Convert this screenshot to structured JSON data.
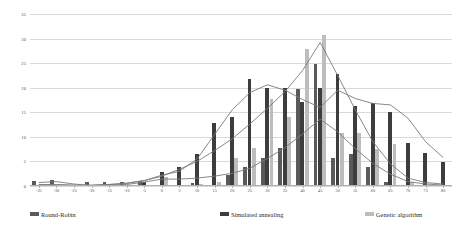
{
  "chart_data": {
    "type": "bar",
    "title": "",
    "subtitle": "",
    "xlabel": "",
    "ylabel": "",
    "xlim": [
      -37.5,
      82.5
    ],
    "ylim": [
      0,
      35
    ],
    "grid": true,
    "legend_position": "bottom",
    "y_ticks": [
      0,
      5,
      10,
      15,
      20,
      25,
      30,
      35
    ],
    "categories": [
      "-35",
      "-30",
      "-25",
      "-20",
      "-15",
      "-10",
      "-5",
      "0",
      "5",
      "10",
      "15",
      "20",
      "25",
      "30",
      "35",
      "40",
      "45",
      "50",
      "55",
      "60",
      "65",
      "70",
      "75",
      "80"
    ],
    "series": [
      {
        "name": "Round-Robin",
        "color": "#5a5a5a",
        "values": [
          1,
          1.2,
          0,
          0.8,
          0.8,
          0.8,
          1,
          0,
          0,
          0.6,
          0,
          2.2,
          3.8,
          5.8,
          7.8,
          19.8,
          24.9,
          5.8,
          6.5,
          3.8,
          0.8,
          0,
          0,
          0
        ]
      },
      {
        "name": "Simulated annealing",
        "color": "#3d3d3d",
        "values": [
          0,
          0,
          0,
          0,
          0,
          0,
          0.8,
          2.8,
          3.8,
          6.5,
          12.8,
          14,
          21.8,
          20,
          20,
          17,
          20,
          22.8,
          16.2,
          16.8,
          15,
          8.8,
          6.8,
          4.8
        ]
      },
      {
        "name": "Genetic algorithm",
        "color": "#bdbdbd",
        "values": [
          0,
          0,
          0,
          0,
          0,
          0,
          0,
          1.8,
          0,
          0.5,
          0.8,
          5.8,
          7.8,
          17.8,
          14,
          27.8,
          30.8,
          10.8,
          10.8,
          7.5,
          8.5,
          0.8,
          0,
          0
        ]
      }
    ],
    "trend_lines": [
      {
        "name": "Round-Robin trend",
        "color": "#7a7a7a",
        "values": [
          0.7,
          0.9,
          0.4,
          0.1,
          0.3,
          0.6,
          1.1,
          2.0,
          3.4,
          5.0,
          7.2,
          9.6,
          12.6,
          15.8,
          19.2,
          23.5,
          29.2,
          22.5,
          15.5,
          9.0,
          4.5,
          1.6,
          0.7,
          0.4
        ]
      },
      {
        "name": "Simulated annealing trend",
        "color": "#7a7a7a",
        "values": [
          0.3,
          0.3,
          0.2,
          0.2,
          0.3,
          0.5,
          1.1,
          2.2,
          3.0,
          5.5,
          10.5,
          15.5,
          19.0,
          20.6,
          19.5,
          17.6,
          16.0,
          19.5,
          17.8,
          16.8,
          16.5,
          13.8,
          9.0,
          5.8
        ]
      },
      {
        "name": "Genetic algorithm trend",
        "color": "#7a7a7a",
        "values": [
          0.2,
          0.2,
          0.1,
          0.1,
          0.2,
          0.3,
          0.8,
          1.4,
          1.4,
          1.6,
          2.0,
          2.6,
          3.6,
          5.6,
          7.8,
          10.6,
          13.6,
          11.0,
          7.6,
          4.6,
          2.4,
          0.9,
          0.4,
          0.2
        ]
      }
    ]
  },
  "legend": {
    "items": [
      {
        "label": "Round-Robin",
        "color": "#5a5a5a"
      },
      {
        "label": "Simulated annealing",
        "color": "#3d3d3d"
      },
      {
        "label": "Genetic algorithm",
        "color": "#bdbdbd"
      }
    ]
  }
}
